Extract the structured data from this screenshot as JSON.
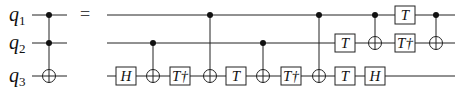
{
  "diagram": {
    "type": "quantum-circuit",
    "qubits": [
      {
        "name": "q",
        "sub": "1"
      },
      {
        "name": "q",
        "sub": "2"
      },
      {
        "name": "q",
        "sub": "3"
      }
    ],
    "equals_sign": "=",
    "lhs": [
      {
        "type": "toffoli",
        "controls": [
          0,
          1
        ],
        "target": 2
      }
    ],
    "rhs": [
      {
        "type": "gate",
        "qubit": 2,
        "label": "H",
        "col": 0
      },
      {
        "type": "cnot",
        "control": 1,
        "target": 2,
        "col": 1
      },
      {
        "type": "gate",
        "qubit": 2,
        "label": "T†",
        "col": 2
      },
      {
        "type": "cnot",
        "control": 0,
        "target": 2,
        "col": 3
      },
      {
        "type": "gate",
        "qubit": 2,
        "label": "T",
        "col": 4
      },
      {
        "type": "cnot",
        "control": 1,
        "target": 2,
        "col": 5
      },
      {
        "type": "gate",
        "qubit": 2,
        "label": "T†",
        "col": 6
      },
      {
        "type": "cnot",
        "control": 0,
        "target": 2,
        "col": 7
      },
      {
        "type": "gate",
        "qubit": 1,
        "label": "T",
        "col": 8
      },
      {
        "type": "gate",
        "qubit": 2,
        "label": "T",
        "col": 8
      },
      {
        "type": "cnot",
        "control": 0,
        "target": 1,
        "col": 9
      },
      {
        "type": "gate",
        "qubit": 2,
        "label": "H",
        "col": 9
      },
      {
        "type": "gate",
        "qubit": 0,
        "label": "T",
        "col": 10
      },
      {
        "type": "gate",
        "qubit": 1,
        "label": "T†",
        "col": 10
      },
      {
        "type": "cnot",
        "control": 0,
        "target": 1,
        "col": 11
      }
    ]
  }
}
